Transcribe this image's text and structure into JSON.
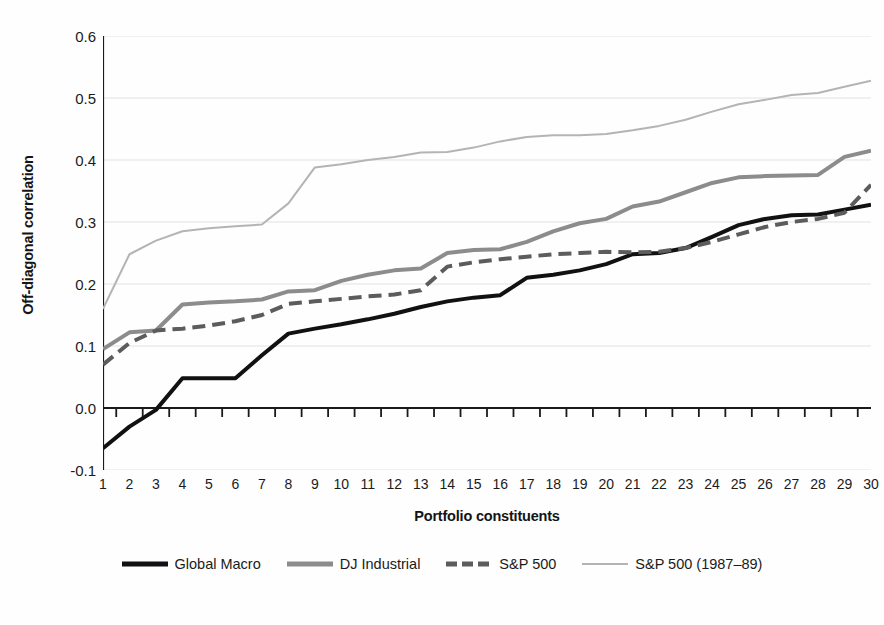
{
  "chart_data": {
    "type": "line",
    "title": "",
    "xlabel": "Portfolio constituents",
    "ylabel": "Off-diagonal correlation",
    "xlim": [
      1,
      30
    ],
    "ylim": [
      -0.1,
      0.6
    ],
    "ytick_labels": [
      "0.6",
      "0.5",
      "0.4",
      "0.3",
      "0.2",
      "0.1",
      "0.0",
      "-0.1"
    ],
    "ytick_values": [
      0.6,
      0.5,
      0.4,
      0.3,
      0.2,
      0.1,
      0.0,
      -0.1
    ],
    "grid": true,
    "grid_axis": "y",
    "legend_position": "bottom",
    "categories": [
      1,
      2,
      3,
      4,
      5,
      6,
      7,
      8,
      9,
      10,
      11,
      12,
      13,
      14,
      15,
      16,
      17,
      18,
      19,
      20,
      21,
      22,
      23,
      24,
      25,
      26,
      27,
      28,
      29,
      30
    ],
    "x": [
      1,
      2,
      3,
      4,
      5,
      6,
      7,
      8,
      9,
      10,
      11,
      12,
      13,
      14,
      15,
      16,
      17,
      18,
      19,
      20,
      21,
      22,
      23,
      24,
      25,
      26,
      27,
      28,
      29,
      30
    ],
    "series": [
      {
        "name": "Global Macro",
        "color": "#111111",
        "style": "solid",
        "width": 4.0,
        "values": [
          -0.065,
          -0.03,
          -0.003,
          0.048,
          0.048,
          0.048,
          0.085,
          0.12,
          0.128,
          0.135,
          0.143,
          0.152,
          0.163,
          0.172,
          0.178,
          0.182,
          0.21,
          0.215,
          0.222,
          0.232,
          0.248,
          0.25,
          0.258,
          0.276,
          0.295,
          0.305,
          0.311,
          0.312,
          0.32,
          0.328
        ]
      },
      {
        "name": "DJ Industrial",
        "color": "#8c8c8c",
        "style": "solid",
        "width": 4.0,
        "values": [
          0.095,
          0.122,
          0.125,
          0.167,
          0.17,
          0.172,
          0.175,
          0.188,
          0.19,
          0.205,
          0.215,
          0.222,
          0.225,
          0.25,
          0.255,
          0.256,
          0.268,
          0.285,
          0.298,
          0.305,
          0.325,
          0.333,
          0.348,
          0.363,
          0.372,
          0.374,
          0.375,
          0.376,
          0.405,
          0.415
        ]
      },
      {
        "name": "S&P 500",
        "color": "#5c5c5c",
        "style": "dashed",
        "width": 4.0,
        "values": [
          0.07,
          0.105,
          0.125,
          0.128,
          0.133,
          0.14,
          0.15,
          0.168,
          0.172,
          0.176,
          0.18,
          0.183,
          0.19,
          0.228,
          0.235,
          0.24,
          0.244,
          0.248,
          0.25,
          0.252,
          0.251,
          0.252,
          0.258,
          0.268,
          0.28,
          0.292,
          0.3,
          0.305,
          0.315,
          0.36
        ]
      },
      {
        "name": "S&P 500 (1987–89)",
        "color": "#b4b4b4",
        "style": "solid",
        "width": 2.0,
        "values": [
          0.16,
          0.248,
          0.27,
          0.285,
          0.29,
          0.293,
          0.296,
          0.33,
          0.388,
          0.393,
          0.4,
          0.405,
          0.412,
          0.413,
          0.42,
          0.43,
          0.437,
          0.44,
          0.44,
          0.442,
          0.448,
          0.455,
          0.465,
          0.478,
          0.49,
          0.497,
          0.505,
          0.508,
          0.518,
          0.528
        ]
      }
    ]
  },
  "axis": {
    "y_title": "Off-diagonal correlation",
    "x_title": "Portfolio constituents"
  },
  "legend": {
    "entries": [
      {
        "label": "Global Macro",
        "color": "#111111",
        "style": "solid",
        "thickness": 5
      },
      {
        "label": "DJ Industrial",
        "color": "#8c8c8c",
        "style": "solid",
        "thickness": 5
      },
      {
        "label": "S&P 500",
        "color": "#5c5c5c",
        "style": "dashed",
        "thickness": 5
      },
      {
        "label": "S&P 500 (1987–89)",
        "color": "#b4b4b4",
        "style": "solid",
        "thickness": 2
      }
    ]
  },
  "colors": {
    "axis": "#1a1a1a",
    "grid": "#e2e2e2",
    "background": "#fefefe",
    "text": "#1b1b1b"
  }
}
